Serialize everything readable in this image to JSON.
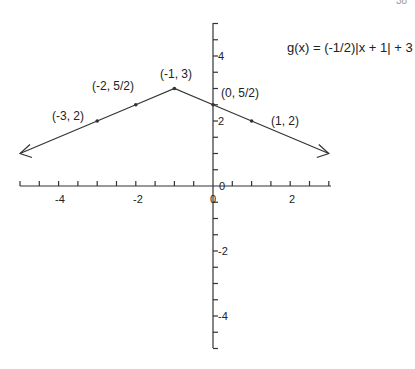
{
  "page_number": "38",
  "chart_data": {
    "type": "line",
    "title": "g(x) = (-1/2)|x + 1| + 3",
    "xlabel": "",
    "ylabel": "",
    "xlim": [
      -5,
      3
    ],
    "ylim": [
      -5,
      5
    ],
    "grid": false,
    "x_tick_labels": [
      "-4",
      "-2",
      "0",
      "2"
    ],
    "y_tick_labels": [
      "4",
      "2",
      "0",
      "-2",
      "-4"
    ],
    "series": [
      {
        "name": "g(x) = (-1/2)|x + 1| + 3",
        "x": [
          -5,
          -3,
          -2,
          -1,
          0,
          1,
          3
        ],
        "y": [
          1,
          2,
          2.5,
          3,
          2.5,
          2,
          1
        ],
        "arrows_both_ends": true
      }
    ],
    "points": [
      {
        "label": "(-3, 2)",
        "x": -3,
        "y": 2
      },
      {
        "label": "(-2, 5/2)",
        "x": -2,
        "y": 2.5
      },
      {
        "label": "(-1, 3)",
        "x": -1,
        "y": 3
      },
      {
        "label": "(0, 5/2)",
        "x": 0,
        "y": 2.5
      },
      {
        "label": "(1, 2)",
        "x": 1,
        "y": 2
      }
    ]
  }
}
